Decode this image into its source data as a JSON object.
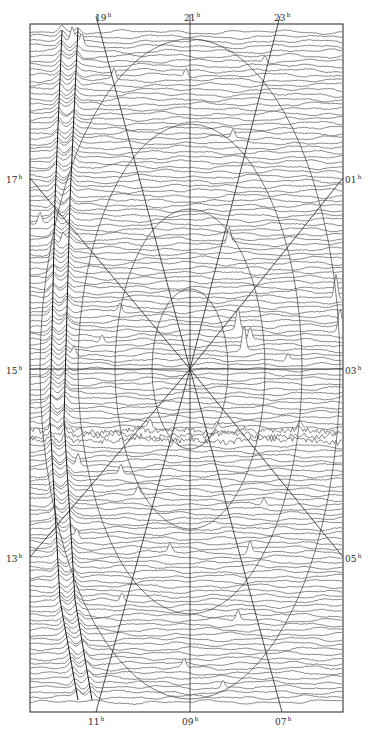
{
  "figure": {
    "type": "stacked-trace radio sky map with right-ascension hour grid",
    "frame": {
      "x": 30,
      "y": 24,
      "width": 313,
      "height": 688
    },
    "center": {
      "x": 190,
      "y": 369
    },
    "colors": {
      "background": "#ffffff",
      "trace": "#3a3a3a",
      "grid": "#222222",
      "label": "#2a2a2a"
    },
    "trace_count": 140,
    "hour_labels": {
      "top": [
        {
          "text": "19",
          "x": 95,
          "y": 12
        },
        {
          "text": "21",
          "x": 184,
          "y": 12
        },
        {
          "text": "23",
          "x": 274,
          "y": 12
        }
      ],
      "left": [
        {
          "text": "17",
          "x": 6,
          "y": 174
        },
        {
          "text": "15",
          "x": 6,
          "y": 365
        },
        {
          "text": "13",
          "x": 6,
          "y": 553
        }
      ],
      "right": [
        {
          "text": "01",
          "x": 345,
          "y": 174
        },
        {
          "text": "03",
          "x": 345,
          "y": 365
        },
        {
          "text": "05",
          "x": 345,
          "y": 553
        }
      ],
      "bottom": [
        {
          "text": "11",
          "x": 88,
          "y": 716
        },
        {
          "text": "09",
          "x": 182,
          "y": 716
        },
        {
          "text": "07",
          "x": 275,
          "y": 716
        }
      ]
    },
    "hour_suffix": "h",
    "grid_lines": [
      {
        "name": "hour-line-21-09",
        "x1": 190,
        "y1": 14,
        "x2": 190,
        "y2": 712
      },
      {
        "name": "hour-line-15-03",
        "x1": 30,
        "y1": 369,
        "x2": 343,
        "y2": 369
      },
      {
        "name": "hour-line-19",
        "x1": 96,
        "y1": 16,
        "x2": 190,
        "y2": 369
      },
      {
        "name": "hour-line-23",
        "x1": 280,
        "y1": 16,
        "x2": 190,
        "y2": 369
      },
      {
        "name": "hour-line-11",
        "x1": 96,
        "y1": 712,
        "x2": 190,
        "y2": 369
      },
      {
        "name": "hour-line-07",
        "x1": 282,
        "y1": 712,
        "x2": 190,
        "y2": 369
      },
      {
        "name": "hour-line-17",
        "x1": 30,
        "y1": 178,
        "x2": 190,
        "y2": 369
      },
      {
        "name": "hour-line-01",
        "x1": 343,
        "y1": 178,
        "x2": 190,
        "y2": 369
      },
      {
        "name": "hour-line-13",
        "x1": 30,
        "y1": 557,
        "x2": 190,
        "y2": 369
      },
      {
        "name": "hour-line-05",
        "x1": 343,
        "y1": 557,
        "x2": 190,
        "y2": 369
      }
    ],
    "ellipses": [
      {
        "rx": 38,
        "ry": 80
      },
      {
        "rx": 75,
        "ry": 160
      },
      {
        "rx": 112,
        "ry": 245
      },
      {
        "rx": 150,
        "ry": 330
      }
    ],
    "ridges": [
      {
        "name": "galactic-plane-ridge-a",
        "points": [
          [
            62,
            30
          ],
          [
            55,
            200
          ],
          [
            50,
            420
          ],
          [
            60,
            600
          ],
          [
            78,
            700
          ]
        ]
      },
      {
        "name": "galactic-plane-ridge-b",
        "points": [
          [
            78,
            28
          ],
          [
            70,
            200
          ],
          [
            64,
            420
          ],
          [
            75,
            600
          ],
          [
            92,
            700
          ]
        ]
      }
    ],
    "peaks": [
      {
        "x": 72,
        "row": 2,
        "h": 14
      },
      {
        "x": 82,
        "row": 3,
        "h": 12
      },
      {
        "x": 114,
        "row": 10,
        "h": 10
      },
      {
        "x": 186,
        "row": 9,
        "h": 8
      },
      {
        "x": 265,
        "row": 6,
        "h": 7
      },
      {
        "x": 233,
        "row": 22,
        "h": 9
      },
      {
        "x": 40,
        "row": 40,
        "h": 12
      },
      {
        "x": 63,
        "row": 44,
        "h": 10
      },
      {
        "x": 120,
        "row": 58,
        "h": 8
      },
      {
        "x": 229,
        "row": 44,
        "h": 16
      },
      {
        "x": 238,
        "row": 62,
        "h": 22
      },
      {
        "x": 244,
        "row": 66,
        "h": 24
      },
      {
        "x": 250,
        "row": 64,
        "h": 12
      },
      {
        "x": 336,
        "row": 55,
        "h": 24
      },
      {
        "x": 340,
        "row": 62,
        "h": 22
      },
      {
        "x": 74,
        "row": 67,
        "h": 10
      },
      {
        "x": 102,
        "row": 64,
        "h": 8
      },
      {
        "x": 150,
        "row": 82,
        "h": 8
      },
      {
        "x": 288,
        "row": 68,
        "h": 7
      },
      {
        "x": 300,
        "row": 82,
        "h": 8
      },
      {
        "x": 78,
        "row": 90,
        "h": 12
      },
      {
        "x": 121,
        "row": 92,
        "h": 10
      },
      {
        "x": 175,
        "row": 86,
        "h": 9
      },
      {
        "x": 217,
        "row": 82,
        "h": 7
      },
      {
        "x": 264,
        "row": 98,
        "h": 8
      },
      {
        "x": 77,
        "row": 105,
        "h": 11
      },
      {
        "x": 138,
        "row": 96,
        "h": 8
      },
      {
        "x": 250,
        "row": 108,
        "h": 12
      },
      {
        "x": 170,
        "row": 108,
        "h": 9
      },
      {
        "x": 238,
        "row": 122,
        "h": 10
      },
      {
        "x": 184,
        "row": 132,
        "h": 9
      },
      {
        "x": 223,
        "row": 136,
        "h": 8
      },
      {
        "x": 122,
        "row": 118,
        "h": 8
      }
    ],
    "noisy_band_row": 84
  }
}
